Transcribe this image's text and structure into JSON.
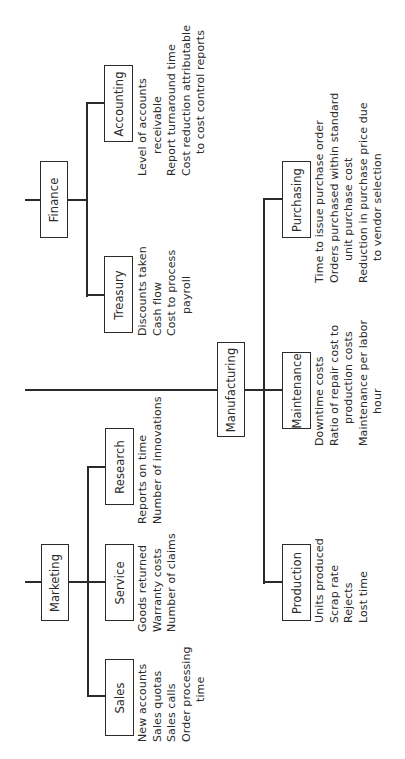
{
  "diagram": {
    "type": "org-chart-performance-measures",
    "orientation": "rotated -90deg",
    "departments": [
      {
        "name": "Finance",
        "units": [
          {
            "name": "Accounting",
            "metrics": [
              "Level of accounts",
              "receivable",
              "Report turnaround time",
              "Cost reduction attributable",
              "to cost control reports"
            ]
          },
          {
            "name": "Treasury",
            "metrics": [
              "Discounts taken",
              "Cash flow",
              "Cost to process",
              "payroll"
            ]
          }
        ]
      },
      {
        "name": "Manufacturing",
        "units": [
          {
            "name": "Purchasing",
            "metrics": [
              "Time to issue purchase order",
              "Orders purchased within standard",
              "unit purchase cost",
              "Reduction in purchase price due",
              "to vendor selection"
            ]
          },
          {
            "name": "Maintenance",
            "metrics": [
              "Downtime costs",
              "Ratio of repair cost to",
              "production costs",
              "Maintenance per labor",
              "hour"
            ]
          },
          {
            "name": "Production",
            "metrics": [
              "Units produced",
              "Scrap rate",
              "Rejects",
              "Lost time"
            ]
          }
        ]
      },
      {
        "name": "Marketing",
        "units": [
          {
            "name": "Research",
            "metrics": [
              "Reports on time",
              "Number of innovations"
            ]
          },
          {
            "name": "Service",
            "metrics": [
              "Goods returned",
              "Warranty costs",
              "Number of claims"
            ]
          },
          {
            "name": "Sales",
            "metrics": [
              "New accounts",
              "Sales quotas",
              "Sales calls",
              "Order processing",
              "time"
            ]
          }
        ]
      }
    ]
  }
}
